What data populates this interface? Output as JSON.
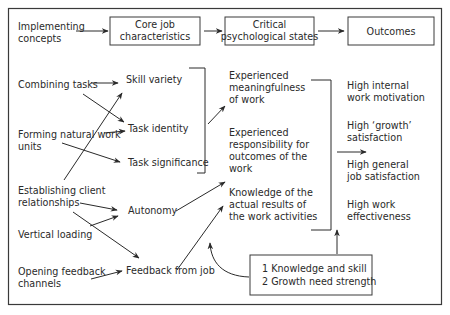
{
  "diagram": {
    "type": "flow",
    "frame": {
      "x": 8,
      "y": 8,
      "width": 434,
      "height": 296
    },
    "header": {
      "implementing_concepts": [
        "Implementing",
        "concepts"
      ],
      "core_job_characteristics": [
        "Core job",
        "characteristics"
      ],
      "critical_psychological_states": [
        "Critical",
        "psychological states"
      ],
      "outcomes": "Outcomes"
    },
    "implementing_concepts": [
      {
        "id": "combining",
        "lines": [
          "Combining tasks"
        ]
      },
      {
        "id": "forming",
        "lines": [
          "Forming natural work",
          "units"
        ]
      },
      {
        "id": "establishing",
        "lines": [
          "Establishing client",
          "relationships"
        ]
      },
      {
        "id": "vertical",
        "lines": [
          "Vertical loading"
        ]
      },
      {
        "id": "opening",
        "lines": [
          "Opening feedback",
          "channels"
        ]
      }
    ],
    "core_job_characteristics": [
      {
        "id": "skill",
        "label": "Skill variety"
      },
      {
        "id": "identity",
        "label": "Task identity"
      },
      {
        "id": "significance",
        "label": "Task significance"
      },
      {
        "id": "autonomy",
        "label": "Autonomy"
      },
      {
        "id": "feedback",
        "label": "Feedback from job"
      }
    ],
    "critical_psychological_states": [
      {
        "id": "meaningfulness",
        "lines": [
          "Experienced",
          "meaningfulness",
          "of work"
        ]
      },
      {
        "id": "responsibility",
        "lines": [
          "Experienced",
          "responsibility for",
          "outcomes of the",
          "work"
        ]
      },
      {
        "id": "knowledge",
        "lines": [
          "Knowledge of the",
          "actual results of",
          "the work activities"
        ]
      }
    ],
    "outcomes": [
      {
        "lines": [
          "High internal",
          "work motivation"
        ]
      },
      {
        "lines": [
          "High ‘growth’",
          "satisfaction"
        ]
      },
      {
        "lines": [
          "High general",
          "job satisfaction"
        ]
      },
      {
        "lines": [
          "High work",
          "effectiveness"
        ]
      }
    ],
    "moderators": [
      "1  Knowledge and skill",
      "2  Growth need strength"
    ],
    "connections": [
      [
        "Implementing concepts",
        "Core job characteristics"
      ],
      [
        "Core job characteristics",
        "Critical psychological states"
      ],
      [
        "Critical psychological states",
        "Outcomes"
      ],
      [
        "Combining tasks",
        "Skill variety"
      ],
      [
        "Combining tasks",
        "Task identity"
      ],
      [
        "Forming natural work units",
        "Task identity"
      ],
      [
        "Forming natural work units",
        "Task significance"
      ],
      [
        "Establishing client relationships",
        "Skill variety"
      ],
      [
        "Establishing client relationships",
        "Autonomy"
      ],
      [
        "Establishing client relationships",
        "Feedback from job"
      ],
      [
        "Vertical loading",
        "Autonomy"
      ],
      [
        "Opening feedback channels",
        "Feedback from job"
      ],
      [
        "Skill variety / Task identity / Task significance",
        "Experienced meaningfulness of work"
      ],
      [
        "Autonomy",
        "Experienced responsibility for outcomes of the work"
      ],
      [
        "Feedback from job",
        "Knowledge of the actual results of the work activities"
      ],
      [
        "Critical psychological states",
        "Outcomes"
      ],
      [
        "Moderators",
        "Knowledge of results link"
      ],
      [
        "Moderators",
        "Outcomes"
      ]
    ]
  }
}
